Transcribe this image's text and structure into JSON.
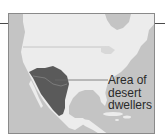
{
  "map": {
    "region": "North America",
    "legend_label_lines": [
      "Area of",
      "desert",
      "dwellers"
    ],
    "colors": {
      "ocean": "#c4c4c4",
      "land": "#ececec",
      "highlight": "#5a5a5a",
      "border_lines": "#b8b8b8",
      "frame": "#8a8a8a",
      "text": "#2a2a2a"
    }
  }
}
